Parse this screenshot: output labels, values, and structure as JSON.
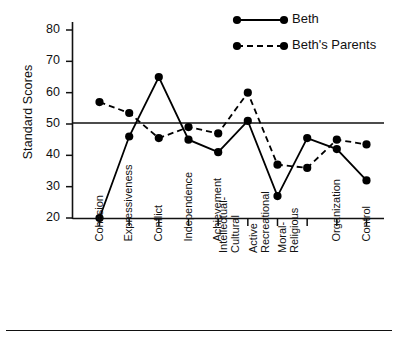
{
  "chart_data": {
    "type": "line",
    "title": "",
    "xlabel": "",
    "ylabel": "Standard Scores",
    "ylim": [
      20,
      85
    ],
    "yticks": [
      20,
      30,
      40,
      50,
      60,
      70,
      80
    ],
    "grid": false,
    "reference_line": 50,
    "legend_position": "top-right",
    "categories": [
      "Cohesion",
      "Expressiveness",
      "Conflict",
      "Independence",
      "Achievement",
      "Intellectual-Cultural",
      "Active Recreational",
      "Moral-Religious",
      "Organization",
      "Control"
    ],
    "category_lines": [
      [
        "Cohesion",
        ""
      ],
      [
        "Expressiveness",
        ""
      ],
      [
        "Conflict",
        ""
      ],
      [
        "Independence",
        ""
      ],
      [
        "Achievement",
        ""
      ],
      [
        "Intellectual-",
        "Cultural"
      ],
      [
        "Active",
        "Recreational"
      ],
      [
        "Moral-",
        "Religious"
      ],
      [
        "Organization",
        ""
      ],
      [
        "Control",
        ""
      ]
    ],
    "series": [
      {
        "name": "Beth",
        "style": "solid",
        "color": "#000000",
        "values": [
          20,
          46,
          65,
          45,
          41,
          51,
          27,
          45.5,
          42,
          32
        ]
      },
      {
        "name": "Beth's Parents",
        "style": "dashed",
        "color": "#000000",
        "values": [
          57,
          53.5,
          45.5,
          49,
          47,
          60,
          37,
          36,
          45,
          43.5
        ]
      }
    ]
  },
  "axis": {
    "y_label": "Standard Scores",
    "y_tick_labels": [
      "80",
      "70",
      "60",
      "50",
      "40",
      "30",
      "20"
    ]
  },
  "legend": {
    "items": [
      {
        "label": "Beth",
        "style": "solid"
      },
      {
        "label": "Beth's Parents",
        "style": "dashed"
      }
    ]
  }
}
